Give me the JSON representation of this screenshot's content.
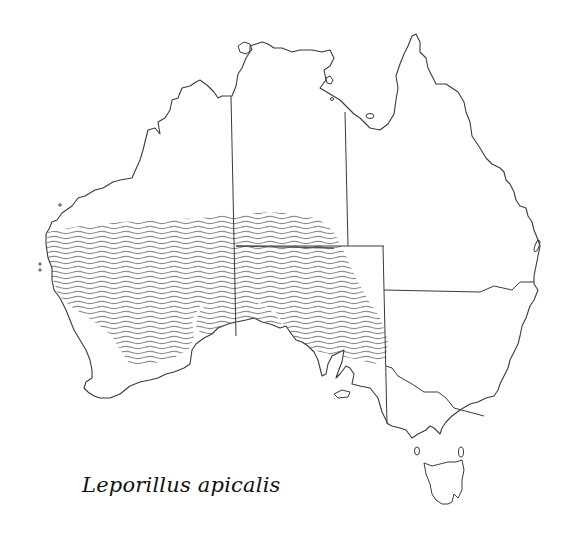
{
  "map": {
    "title": "Leporillus apicalis",
    "subject": "Distribution map of Australia",
    "distribution_pattern": "wavy-hatched",
    "colors": {
      "coastline": "#3a3a3a",
      "border": "#3a3a3a",
      "hatch": "#8c8c8c",
      "background": "#ffffff"
    },
    "regions": [
      "Western Australia",
      "Northern Territory",
      "Queensland",
      "South Australia",
      "New South Wales",
      "Victoria",
      "Tasmania"
    ]
  }
}
